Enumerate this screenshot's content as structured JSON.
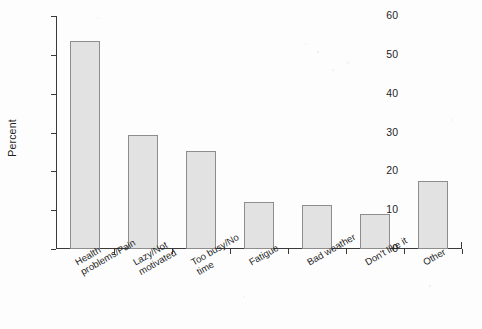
{
  "chart_data": {
    "type": "bar",
    "title": "",
    "subtitle": "",
    "xlabel": "",
    "ylabel": "Percent",
    "ylim": [
      0,
      60
    ],
    "ytick_values": [
      0,
      10,
      20,
      30,
      40,
      50,
      60
    ],
    "ytick_labels": [
      "0",
      "10",
      "20",
      "30",
      "40",
      "50",
      "60"
    ],
    "grid": false,
    "legend": false,
    "legend_position": "none",
    "categories": [
      "Health\nproblems/Pain",
      "Lazy/Not\nmotivated",
      "Too busy/No\ntime",
      "Fatigue",
      "Bad weather",
      "Don't like it",
      "Other"
    ],
    "category_lines": [
      [
        "Health",
        "problems/Pain"
      ],
      [
        "Lazy/Not",
        "motivated"
      ],
      [
        "Too busy/No",
        "time"
      ],
      [
        "Fatigue",
        ""
      ],
      [
        "Bad weather",
        ""
      ],
      [
        "Don't like it",
        ""
      ],
      [
        "Other",
        ""
      ]
    ],
    "values": [
      53.6,
      29.4,
      25.3,
      12.0,
      11.4,
      8.9,
      17.6
    ],
    "bar_fill_color": "#e2e2e2",
    "bar_edge_color": "#8d8d8d",
    "axis_color": "#3a3a3a",
    "background_color": "#fdfdfd",
    "tick_label_rotation": -30
  }
}
